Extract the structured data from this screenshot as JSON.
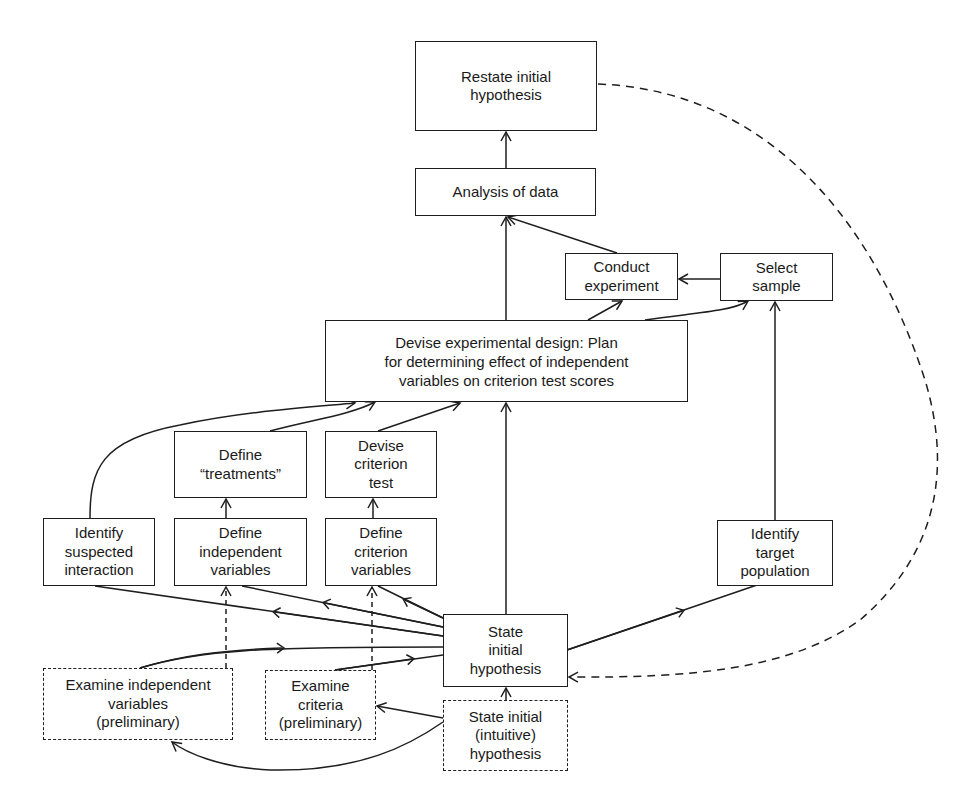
{
  "diagram": {
    "type": "flowchart",
    "nodes": [
      {
        "id": "restate",
        "label": "Restate initial\nhypothesis",
        "style": "solid"
      },
      {
        "id": "analysis",
        "label": "Analysis of data",
        "style": "solid"
      },
      {
        "id": "conduct",
        "label": "Conduct\nexperiment",
        "style": "solid"
      },
      {
        "id": "select",
        "label": "Select\nsample",
        "style": "solid"
      },
      {
        "id": "devise_design",
        "label": "Devise experimental design: Plan\nfor determining effect of independent\nvariables on criterion test  scores",
        "style": "solid"
      },
      {
        "id": "define_treatments",
        "label": "Define\n“treatments”",
        "style": "solid"
      },
      {
        "id": "devise_test",
        "label": "Devise\ncriterion\ntest",
        "style": "solid"
      },
      {
        "id": "identify_interaction",
        "label": "Identify\nsuspected\ninteraction",
        "style": "solid"
      },
      {
        "id": "define_independent",
        "label": "Define\nindependent\nvariables",
        "style": "solid"
      },
      {
        "id": "define_criterion",
        "label": "Define\ncriterion\nvariables",
        "style": "solid"
      },
      {
        "id": "identify_population",
        "label": "Identify\ntarget\npopulation",
        "style": "solid"
      },
      {
        "id": "state_initial",
        "label": "State\ninitial\nhypothesis",
        "style": "solid"
      },
      {
        "id": "examine_independent",
        "label": "Examine independent\nvariables\n(preliminary)",
        "style": "dashed"
      },
      {
        "id": "examine_criteria",
        "label": "Examine\ncriteria\n(preliminary)",
        "style": "dashed"
      },
      {
        "id": "state_intuitive",
        "label": "State initial\n(intuitive)\nhypothesis",
        "style": "dashed"
      }
    ],
    "edges": [
      {
        "from": "analysis",
        "to": "restate",
        "style": "solid"
      },
      {
        "from": "devise_design",
        "to": "analysis",
        "style": "solid"
      },
      {
        "from": "conduct",
        "to": "analysis",
        "style": "solid"
      },
      {
        "from": "select",
        "to": "conduct",
        "style": "solid"
      },
      {
        "from": "devise_design",
        "to": "conduct",
        "style": "solid"
      },
      {
        "from": "devise_design",
        "to": "select",
        "style": "solid"
      },
      {
        "from": "identify_population",
        "to": "select",
        "style": "solid"
      },
      {
        "from": "identify_interaction",
        "to": "devise_design",
        "style": "solid"
      },
      {
        "from": "define_treatments",
        "to": "devise_design",
        "style": "solid"
      },
      {
        "from": "devise_test",
        "to": "devise_design",
        "style": "solid"
      },
      {
        "from": "state_initial",
        "to": "devise_design",
        "style": "solid"
      },
      {
        "from": "define_independent",
        "to": "define_treatments",
        "style": "solid"
      },
      {
        "from": "define_criterion",
        "to": "devise_test",
        "style": "solid"
      },
      {
        "from": "state_initial",
        "to": "identify_interaction",
        "style": "solid"
      },
      {
        "from": "state_initial",
        "to": "define_independent",
        "style": "solid"
      },
      {
        "from": "state_initial",
        "to": "define_criterion",
        "style": "solid"
      },
      {
        "from": "state_initial",
        "to": "identify_population",
        "style": "solid"
      },
      {
        "from": "examine_independent",
        "to": "state_initial",
        "style": "solid"
      },
      {
        "from": "examine_criteria",
        "to": "state_initial",
        "style": "solid"
      },
      {
        "from": "examine_independent",
        "to": "define_independent",
        "style": "dashed"
      },
      {
        "from": "examine_criteria",
        "to": "define_criterion",
        "style": "dashed"
      },
      {
        "from": "state_intuitive",
        "to": "state_initial",
        "style": "solid"
      },
      {
        "from": "state_intuitive",
        "to": "examine_criteria",
        "style": "solid"
      },
      {
        "from": "state_intuitive",
        "to": "examine_independent",
        "style": "solid"
      },
      {
        "from": "restate",
        "to": "state_initial",
        "style": "dashed"
      }
    ]
  },
  "colors": {
    "stroke": "#1e1e1e",
    "background": "#ffffff",
    "text": "#1a1a1a"
  }
}
